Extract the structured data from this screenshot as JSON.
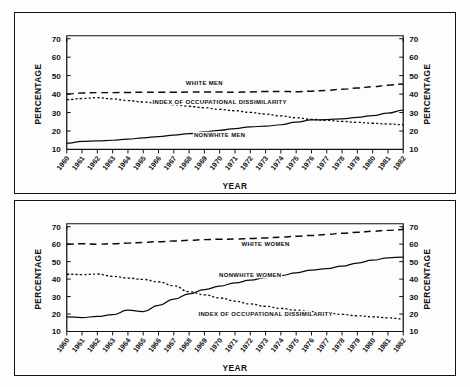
{
  "figure": {
    "background": "#ffffff",
    "ink_color": "#111111"
  },
  "chart_data": [
    {
      "id": "men",
      "type": "line",
      "title": "",
      "xlabel": "YEAR",
      "ylabel": "PERCENTAGE",
      "ylabel_right": "PERCENTAGE",
      "xlim": [
        1960,
        1982
      ],
      "ylim": [
        10,
        70
      ],
      "yticks": [
        10,
        20,
        30,
        40,
        50,
        60,
        70
      ],
      "grid": false,
      "legend_position": "inline-annotations",
      "categories": [
        1960,
        1961,
        1962,
        1963,
        1964,
        1965,
        1966,
        1967,
        1968,
        1969,
        1970,
        1971,
        1972,
        1973,
        1974,
        1975,
        1976,
        1977,
        1978,
        1979,
        1980,
        1981,
        1982
      ],
      "tick_labels": [
        "1960",
        "1961",
        "1962",
        "1963",
        "1964",
        "1965",
        "1966",
        "1967",
        "1968",
        "1969",
        "1970",
        "1971",
        "1972",
        "1973",
        "1974",
        "1975",
        "1976",
        "1977",
        "1978",
        "1979",
        "1980",
        "1981",
        "1982"
      ],
      "series": [
        {
          "name": "WHITE MEN",
          "style": "dashed",
          "label_x": 1969,
          "label_y": 45.0,
          "values": [
            40.0,
            40.6,
            40.8,
            40.8,
            40.9,
            41.0,
            41.0,
            41.0,
            41.1,
            41.2,
            41.1,
            41.0,
            41.2,
            41.4,
            41.4,
            41.3,
            41.6,
            42.0,
            42.6,
            43.3,
            44.0,
            44.8,
            45.5
          ]
        },
        {
          "name": "INDEX OF OCCUPATIONAL DISSIMILARITY",
          "style": "dotted",
          "label_x": 1970,
          "label_y": 34.5,
          "values": [
            37.0,
            37.6,
            38.1,
            37.4,
            36.5,
            35.7,
            35.0,
            34.2,
            33.4,
            32.6,
            31.7,
            31.0,
            30.1,
            29.2,
            28.2,
            27.2,
            26.3,
            25.8,
            25.2,
            24.7,
            24.2,
            23.8,
            23.4
          ]
        },
        {
          "name": "NONWHITE MEN",
          "style": "solid",
          "label_x": 1970,
          "label_y": 16.5,
          "values": [
            13.4,
            14.4,
            14.7,
            15.0,
            15.6,
            16.3,
            17.0,
            17.8,
            18.6,
            19.5,
            20.4,
            21.3,
            22.3,
            22.6,
            23.4,
            24.8,
            26.0,
            26.2,
            26.6,
            27.4,
            28.4,
            29.7,
            31.3
          ]
        }
      ]
    },
    {
      "id": "women",
      "type": "line",
      "title": "",
      "xlabel": "YEAR",
      "ylabel": "PERCENTAGE",
      "ylabel_right": "PERCENTAGE",
      "xlim": [
        1960,
        1982
      ],
      "ylim": [
        10,
        70
      ],
      "yticks": [
        10,
        20,
        30,
        40,
        50,
        60,
        70
      ],
      "grid": false,
      "legend_position": "inline-annotations",
      "categories": [
        1960,
        1961,
        1962,
        1963,
        1964,
        1965,
        1966,
        1967,
        1968,
        1969,
        1970,
        1971,
        1972,
        1973,
        1974,
        1975,
        1976,
        1977,
        1978,
        1979,
        1980,
        1981,
        1982
      ],
      "tick_labels": [
        "1960",
        "1961",
        "1962",
        "1963",
        "1964",
        "1965",
        "1966",
        "1967",
        "1968",
        "1969",
        "1970",
        "1971",
        "1972",
        "1973",
        "1974",
        "1975",
        "1976",
        "1977",
        "1978",
        "1979",
        "1980",
        "1981",
        "1982"
      ],
      "series": [
        {
          "name": "WHITE WOMEN",
          "style": "dashed",
          "label_x": 1973,
          "label_y": 59.0,
          "values": [
            60.0,
            60.2,
            60.0,
            60.3,
            60.6,
            61.0,
            61.4,
            61.8,
            62.2,
            62.6,
            62.8,
            62.9,
            63.2,
            63.6,
            64.0,
            64.5,
            65.0,
            65.6,
            66.2,
            66.8,
            67.4,
            67.9,
            68.4
          ]
        },
        {
          "name": "NONWHITE WOMEN",
          "style": "solid",
          "label_x": 1972,
          "label_y": 41.0,
          "values": [
            18.4,
            18.0,
            18.6,
            19.6,
            22.2,
            21.4,
            25.0,
            28.6,
            31.6,
            34.0,
            36.0,
            37.8,
            39.4,
            40.8,
            42.0,
            43.6,
            45.2,
            46.0,
            47.4,
            49.2,
            50.8,
            52.2,
            52.6
          ]
        },
        {
          "name": "INDEX OF OCCUPATIONAL DISSIMILARITY",
          "style": "dotted",
          "label_x": 1973,
          "label_y": 19.0,
          "values": [
            42.8,
            42.6,
            42.9,
            41.6,
            40.6,
            39.8,
            38.4,
            36.2,
            32.8,
            31.0,
            29.2,
            27.4,
            25.8,
            24.4,
            23.2,
            22.2,
            21.4,
            20.6,
            19.8,
            19.0,
            18.4,
            17.8,
            17.2
          ]
        }
      ]
    }
  ]
}
